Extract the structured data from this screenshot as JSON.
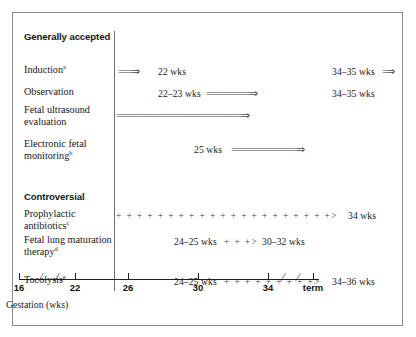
{
  "figure": {
    "axis": {
      "caption": "Gestation (wks)",
      "ticks": [
        {
          "label": "16",
          "x": 6
        },
        {
          "label": "22",
          "x": 62
        },
        {
          "label": "26",
          "x": 115
        },
        {
          "label": "30",
          "x": 185
        },
        {
          "label": "34",
          "x": 255
        },
        {
          "label": "term",
          "x": 300
        }
      ],
      "breaks": [
        28,
        44,
        270,
        285
      ]
    },
    "sections": [
      {
        "heading": "Generally accepted",
        "rows": [
          {
            "label": "Induction",
            "superscript": "a",
            "segments": [
              {
                "kind": "arrow-double",
                "text": "===⇒",
                "x": 4
              },
              {
                "kind": "wks",
                "text": "22 wks",
                "x": 44
              },
              {
                "kind": "wks",
                "text": "34–35 wks",
                "x": 218
              },
              {
                "kind": "arrow-double",
                "text": "=⇒",
                "x": 268
              }
            ]
          },
          {
            "label": "Observation",
            "superscript": "",
            "segments": [
              {
                "kind": "wks",
                "text": "22–23 wks",
                "x": 44
              },
              {
                "kind": "arrow-double",
                "text": "==========⇒",
                "x": 92
              },
              {
                "kind": "wks",
                "text": "34–35 wks",
                "x": 218
              }
            ]
          },
          {
            "label": "Fetal ultrasound evaluation",
            "superscript": "",
            "segments": [
              {
                "kind": "arrow-double",
                "text": "=============================⇒",
                "x": 2
              }
            ]
          },
          {
            "label": "Electronic fetal monitoring",
            "superscript": "b",
            "segments": [
              {
                "kind": "wks",
                "text": "25 wks",
                "x": 80
              },
              {
                "kind": "arrow-double",
                "text": "===============⇒",
                "x": 117
              }
            ]
          }
        ]
      },
      {
        "heading": "Controversial",
        "rows": [
          {
            "label": "Prophylactic antibiotics",
            "superscript": "c",
            "segments": [
              {
                "kind": "plus",
                "text": "+ + + + + + + + + + + + + + + + + + + + +>",
                "x": 2
              },
              {
                "kind": "wks",
                "text": "34 wks",
                "x": 234
              }
            ]
          },
          {
            "label": "Fetal lung maturation therapy",
            "superscript": "d",
            "segments": [
              {
                "kind": "wks",
                "text": "24–25 wks",
                "x": 60
              },
              {
                "kind": "plus",
                "text": "+ + +>",
                "x": 110
              },
              {
                "kind": "wks",
                "text": "30–32 wks",
                "x": 148
              }
            ]
          },
          {
            "label": "Tocolysis",
            "superscript": "e",
            "segments": [
              {
                "kind": "wks",
                "text": "24–25 wks",
                "x": 60
              },
              {
                "kind": "plus",
                "text": "+ + + + + + + + +>",
                "x": 110
              },
              {
                "kind": "wks",
                "text": "34–36 wks",
                "x": 218
              }
            ]
          }
        ]
      }
    ]
  }
}
